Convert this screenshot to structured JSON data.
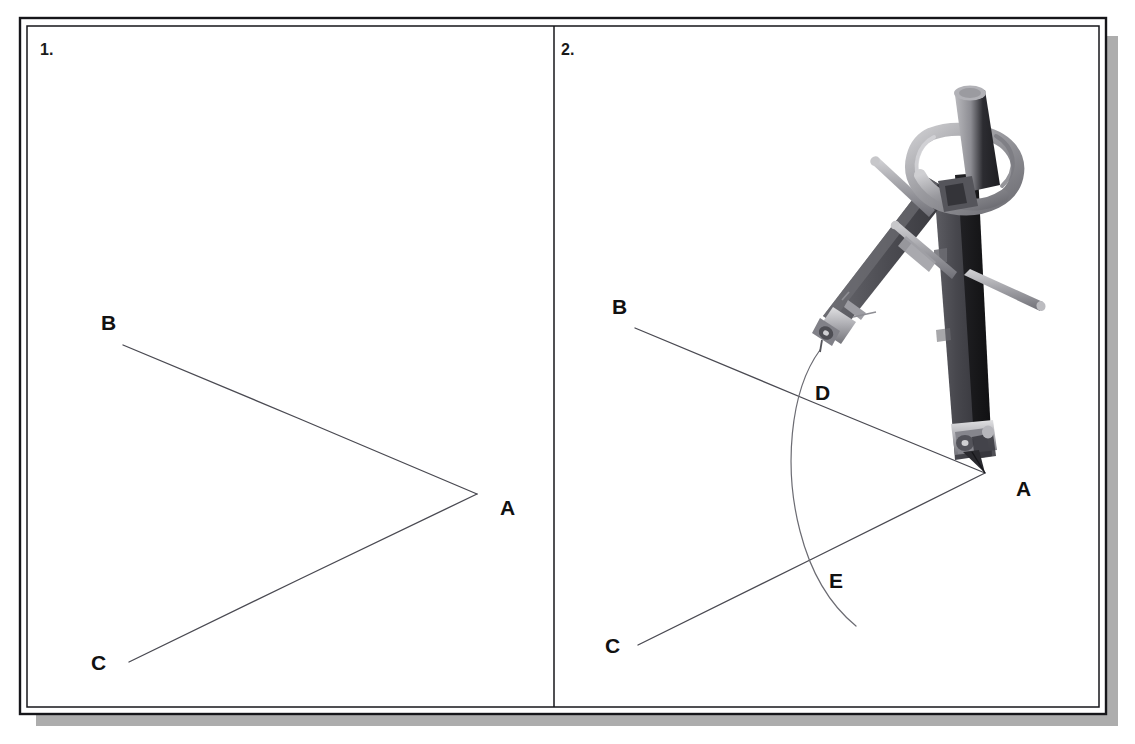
{
  "figure": {
    "background_color": "#ffffff",
    "frame": {
      "border_color": "#16161a",
      "shadow_color": "#adadad",
      "outer": {
        "x": 20,
        "y": 18,
        "width": 1086,
        "height": 696
      },
      "inner": {
        "x": 27,
        "y": 26,
        "width": 1072,
        "height": 681
      },
      "divider_x": 554
    }
  },
  "panels": [
    {
      "number": "1.",
      "number_pos": {
        "x": 40,
        "y": 55
      },
      "labels": [
        {
          "text": "B",
          "x": 101,
          "y": 330
        },
        {
          "text": "A",
          "x": 500,
          "y": 515
        },
        {
          "text": "C",
          "x": 91,
          "y": 670
        }
      ],
      "rays": [
        {
          "name": "ray-AB",
          "from": {
            "x": 123,
            "y": 345
          },
          "to": {
            "x": 477,
            "y": 494
          }
        },
        {
          "name": "ray-AC",
          "from": {
            "x": 129,
            "y": 662
          },
          "to": {
            "x": 477,
            "y": 494
          }
        }
      ],
      "vertex": {
        "x": 477,
        "y": 494
      }
    },
    {
      "number": "2.",
      "number_pos": {
        "x": 561,
        "y": 55
      },
      "labels": [
        {
          "text": "B",
          "x": 612,
          "y": 314
        },
        {
          "text": "D",
          "x": 815,
          "y": 400
        },
        {
          "text": "A",
          "x": 1016,
          "y": 496
        },
        {
          "text": "E",
          "x": 829,
          "y": 588
        },
        {
          "text": "C",
          "x": 605,
          "y": 653
        }
      ],
      "rays": [
        {
          "name": "ray-AB",
          "from": {
            "x": 635,
            "y": 328
          },
          "to": {
            "x": 985,
            "y": 473
          }
        },
        {
          "name": "ray-AC",
          "from": {
            "x": 638,
            "y": 645
          },
          "to": {
            "x": 985,
            "y": 473
          }
        }
      ],
      "vertex": {
        "x": 985,
        "y": 473
      },
      "arc": {
        "name": "compass-arc-DE",
        "center": {
          "x": 985,
          "y": 473
        },
        "radius": 180,
        "start": {
          "x": 820,
          "y": 350
        },
        "end": {
          "x": 856,
          "y": 626
        },
        "intersections": [
          {
            "label": "D",
            "x": 806,
            "y": 380
          },
          {
            "label": "E",
            "x": 806,
            "y": 569
          }
        ]
      },
      "compass": {
        "name": "drawing-compass",
        "description": "metal drawing compass with grip knob, hinged legs, pencil lead holder and needle point",
        "colors": {
          "leg_dark": "#4b4b50",
          "leg_darkest": "#232327",
          "metal_light": "#c3c3c6",
          "metal_mid": "#8f8f94",
          "metal_shadow": "#6a6a70"
        },
        "needle_point": {
          "x": 985,
          "y": 473
        },
        "pencil_point": {
          "x": 820,
          "y": 350
        }
      }
    }
  ],
  "icons": {
    "compass": "compass-icon"
  }
}
